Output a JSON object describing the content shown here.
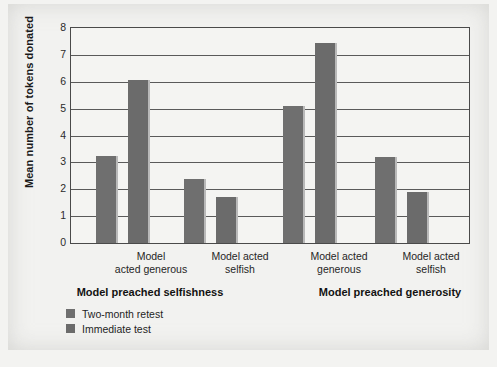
{
  "chart_data": {
    "type": "bar",
    "title": "",
    "xlabel": "",
    "ylabel": "Mean number of tokens donated",
    "ylim": [
      0,
      8
    ],
    "ytick_labels": [
      "8",
      "7",
      "6",
      "5",
      "4",
      "3",
      "2",
      "1",
      "0"
    ],
    "ytick_values": [
      8,
      7,
      6,
      5,
      4,
      3,
      2,
      1,
      0
    ],
    "grid": true,
    "legend_position": "below-left",
    "series": [
      {
        "name": "Two-month retest",
        "color": "#6f6f6f",
        "values": [
          3.25,
          2.4,
          5.1,
          3.2
        ]
      },
      {
        "name": "Immediate test",
        "color": "#6b6b6b",
        "values": [
          6.05,
          1.7,
          7.45,
          1.9
        ]
      }
    ],
    "categories": [
      "Model acted generous",
      "Model acted selfish",
      "Model acted generous",
      "Model acted selfish"
    ],
    "category_lines": [
      [
        "Model",
        "acted generous"
      ],
      [
        "Model acted",
        "selfish"
      ],
      [
        "Model acted",
        "generous"
      ],
      [
        "Model acted",
        "selfish"
      ]
    ],
    "group_titles": [
      "Model preached selfishness",
      "Model preached generosity"
    ]
  },
  "legend": {
    "items": [
      {
        "label": "Two-month retest"
      },
      {
        "label": "Immediate test"
      }
    ]
  },
  "colors": {
    "bar_primary": "#6f6f6f",
    "bar_secondary": "#6b6b6b",
    "axis": "#4a4a4a",
    "grid": "#5a5a5a",
    "page_background": "#f2f2f0"
  }
}
